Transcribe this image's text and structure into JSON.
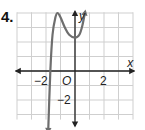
{
  "problem_number": "4.",
  "colors": {
    "grid": "#cfcfcf",
    "axis": "#222222",
    "curve": "#6e6e6e"
  },
  "chart_data": {
    "type": "line",
    "title": "",
    "xlabel": "x",
    "ylabel": "y",
    "origin_label": "O",
    "x_tick_labels": [
      {
        "x": -2,
        "label": "−2"
      },
      {
        "x": 2,
        "label": "2"
      }
    ],
    "y_tick_labels": [
      {
        "y": -2,
        "label": "−2"
      }
    ],
    "xlim": [
      -4,
      4
    ],
    "ylim": [
      -4,
      4
    ],
    "grid": true,
    "series": [
      {
        "name": "polynomial curve",
        "points": [
          [
            -1.85,
            -4.2
          ],
          [
            -1.7,
            0
          ],
          [
            -1.55,
            2.5
          ],
          [
            -1.35,
            3.7
          ],
          [
            -1.2,
            4.0
          ],
          [
            -1.0,
            3.7
          ],
          [
            -0.7,
            3.0
          ],
          [
            -0.4,
            2.5
          ],
          [
            0,
            2.3
          ],
          [
            0.3,
            2.5
          ],
          [
            0.5,
            3.1
          ],
          [
            0.7,
            4.1
          ]
        ],
        "arrows": [
          "start",
          "end"
        ]
      }
    ]
  }
}
